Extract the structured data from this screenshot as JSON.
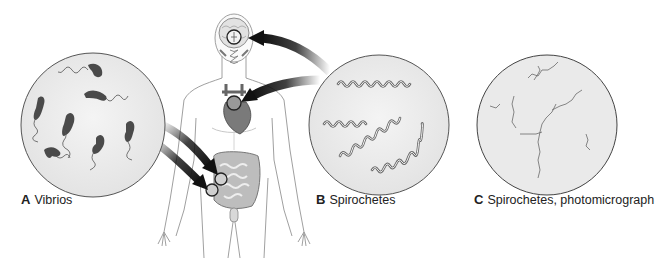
{
  "figure": {
    "panels": [
      {
        "letter": "A",
        "caption": "Vibrios",
        "site": "intestine"
      },
      {
        "letter": "B",
        "caption": "Spirochetes",
        "site": "brain and heart"
      },
      {
        "letter": "C",
        "caption": "Spirochetes, photomicrograph"
      }
    ]
  },
  "colors": {
    "circle_fill": "#ececec",
    "circle_stroke": "#555555",
    "bacteria": "#4a4a4a",
    "body_outline": "#9a9a9a",
    "organ": "#8a8a8a",
    "arrow": "#111111"
  }
}
